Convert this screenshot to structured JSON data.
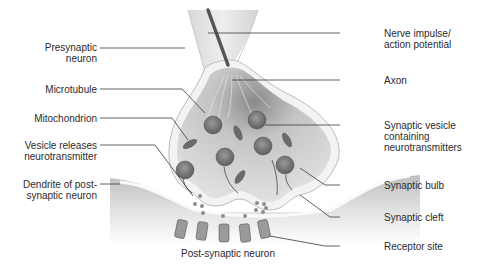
{
  "diagram": {
    "type": "synapse-anatomy",
    "labels_left": [
      {
        "id": "presynaptic",
        "text": "Presynaptic\nneuron"
      },
      {
        "id": "microtubule",
        "text": "Microtubule"
      },
      {
        "id": "mitochondrion",
        "text": "Mitochondrion"
      },
      {
        "id": "vesicle-releases",
        "text": "Vesicle releases\nneurotransmitter"
      },
      {
        "id": "dendrite",
        "text": "Dendrite of post-\nsynaptic neuron"
      }
    ],
    "labels_right": [
      {
        "id": "nerve-impulse",
        "text": "Nerve impulse/\naction potential"
      },
      {
        "id": "axon",
        "text": "Axon"
      },
      {
        "id": "synaptic-vesicle",
        "text": "Synaptic vesicle\ncontaining\nneurotransmitters"
      },
      {
        "id": "synaptic-bulb",
        "text": "Synaptic bulb"
      },
      {
        "id": "synaptic-cleft",
        "text": "Synaptic cleft"
      },
      {
        "id": "receptor-site",
        "text": "Receptor site"
      }
    ],
    "bottom_label": "Post-synaptic neuron",
    "colors": {
      "membrane": "#f4f4f4",
      "cytoplasm": "#cfcfcf",
      "vesicle": "#7a7a7a",
      "shadow": "#bdbdbd",
      "leader_line": "#3a3a3a"
    }
  }
}
